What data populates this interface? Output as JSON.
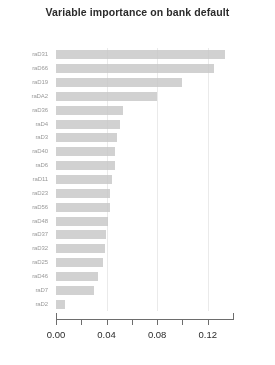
{
  "chart_data": {
    "type": "bar",
    "orientation": "horizontal",
    "title": "Variable importance on bank default",
    "xlabel": "",
    "ylabel": "",
    "xlim": [
      0.0,
      0.14
    ],
    "grid": true,
    "legend": null,
    "axis_tick_values": [
      0.0,
      0.02,
      0.04,
      0.06,
      0.08,
      0.1,
      0.12
    ],
    "axis_tick_labels": [
      "0.00",
      "",
      "0.04",
      "",
      "0.08",
      "",
      "0.12"
    ],
    "categories": [
      "raD31",
      "raD66",
      "raD19",
      "raDA2",
      "raD36",
      "raD4",
      "raD3",
      "raD40",
      "raD6",
      "raD11",
      "raD23",
      "raD56",
      "raD48",
      "raD37",
      "raD32",
      "raD25",
      "raD46",
      "raD7",
      "raD2"
    ],
    "values": [
      0.134,
      0.125,
      0.1,
      0.08,
      0.053,
      0.051,
      0.048,
      0.047,
      0.0465,
      0.044,
      0.043,
      0.0425,
      0.041,
      0.0395,
      0.0385,
      0.0375,
      0.0335,
      0.03,
      0.007
    ]
  },
  "tick_labels": {
    "t0": "0.00",
    "t1": "0.04",
    "t2": "0.08",
    "t3": "0.12"
  }
}
